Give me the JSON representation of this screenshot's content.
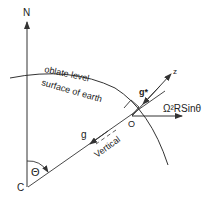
{
  "diagram": {
    "labels": {
      "north": "N",
      "surface_line1": "oblate level",
      "surface_line2": "surface of earth",
      "gravity_star": "g*",
      "z_axis": "z",
      "centrifugal": "Ω²RSinθ",
      "origin": "O",
      "gravity": "g",
      "vertical": "Vertical",
      "center": "C",
      "angle": "Θ"
    },
    "colors": {
      "stroke": "#333333",
      "background": "#ffffff"
    }
  }
}
